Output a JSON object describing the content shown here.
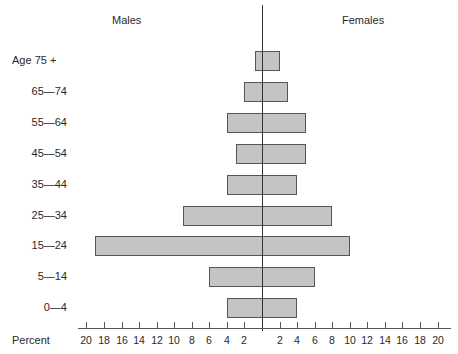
{
  "chart_data": {
    "type": "bar",
    "subtype": "population-pyramid",
    "title": "",
    "left_title": "Males",
    "right_title": "Females",
    "ylabel_prefix": "Age",
    "xlabel": "Percent",
    "categories": [
      "75+",
      "65—74",
      "55—64",
      "45—54",
      "35—44",
      "25—34",
      "15—24",
      "5—14",
      "0—4"
    ],
    "category_labels": [
      "Age  75 +",
      "65—74",
      "55—64",
      "45—54",
      "35—44",
      "25—34",
      "15—24",
      "5—14",
      "0—4"
    ],
    "series": [
      {
        "name": "Males",
        "side": "left",
        "values": [
          0.8,
          2,
          4,
          3,
          4,
          9,
          19,
          6,
          4
        ]
      },
      {
        "name": "Females",
        "side": "right",
        "values": [
          2,
          3,
          5,
          5,
          4,
          8,
          10,
          6,
          4
        ]
      }
    ],
    "xlim": [
      -20,
      20
    ],
    "left_ticks": [
      "20",
      "18",
      "16",
      "14",
      "12",
      "10",
      "8",
      "6",
      "4",
      "2"
    ],
    "right_ticks": [
      "2",
      "4",
      "6",
      "8",
      "10",
      "12",
      "14",
      "16",
      "18",
      "20"
    ],
    "grid": false,
    "legend": "none",
    "bar_color": "#c4c4c4",
    "bar_edge_color": "#555555"
  }
}
